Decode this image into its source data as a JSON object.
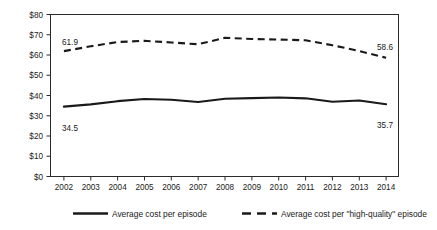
{
  "chart_data": {
    "type": "line",
    "title": "",
    "xlabel": "",
    "ylabel": "",
    "categories": [
      "2002",
      "2003",
      "2004",
      "2005",
      "2006",
      "2007",
      "2008",
      "2009",
      "2010",
      "2011",
      "2012",
      "2013",
      "2014"
    ],
    "ylim": [
      0,
      80
    ],
    "yticks": [
      0,
      10,
      20,
      30,
      40,
      50,
      60,
      70,
      80
    ],
    "ytick_labels": [
      "$0",
      "$10",
      "$20",
      "$30",
      "$40",
      "$50",
      "$60",
      "$70",
      "$80"
    ],
    "grid": false,
    "legend_position": "bottom",
    "series": [
      {
        "name": "Average cost per episode",
        "style": "solid",
        "color": "#1a1a1a",
        "values": [
          34.5,
          35.6,
          37.2,
          38.3,
          37.9,
          36.8,
          38.4,
          38.7,
          39.0,
          38.6,
          36.9,
          37.5,
          35.7
        ]
      },
      {
        "name": "Average cost per \"high-quality\" episode",
        "style": "dashed",
        "color": "#1a1a1a",
        "values": [
          61.9,
          64.3,
          66.4,
          67.0,
          66.2,
          65.3,
          68.5,
          67.9,
          67.6,
          67.3,
          64.8,
          62.0,
          58.6
        ]
      }
    ],
    "annotations": [
      {
        "text": "61.9",
        "series": "Average cost per \"high-quality\" episode",
        "category": "2002",
        "position": "above-right"
      },
      {
        "text": "58.6",
        "series": "Average cost per \"high-quality\" episode",
        "category": "2014",
        "position": "above-left"
      },
      {
        "text": "34.5",
        "series": "Average cost per episode",
        "category": "2002",
        "position": "below-right"
      },
      {
        "text": "35.7",
        "series": "Average cost per episode",
        "category": "2014",
        "position": "below-left"
      }
    ]
  },
  "axis": {
    "y_labels": [
      "$80",
      "$70",
      "$60",
      "$50",
      "$40",
      "$30",
      "$20",
      "$10",
      "$0"
    ],
    "x_labels": [
      "2002",
      "2003",
      "2004",
      "2005",
      "2006",
      "2007",
      "2008",
      "2009",
      "2010",
      "2011",
      "2012",
      "2013",
      "2014"
    ]
  },
  "annotations": {
    "dashed_start": "61.9",
    "dashed_end": "58.6",
    "solid_start": "34.5",
    "solid_end": "35.7"
  },
  "legend": {
    "items": [
      {
        "label": "Average cost per episode",
        "style": "solid"
      },
      {
        "label": "Average cost per \"high-quality\" episode",
        "style": "dashed"
      }
    ]
  },
  "colors": {
    "line": "#1a1a1a",
    "axis": "#2b2b2b",
    "background": "#ffffff"
  }
}
